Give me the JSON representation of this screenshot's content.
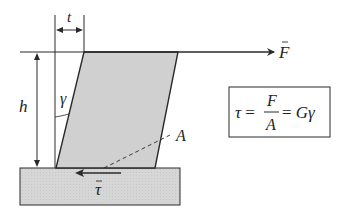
{
  "diagram": {
    "labels": {
      "thickness": "t",
      "height": "h",
      "angle": "γ",
      "force": "F",
      "area": "A",
      "shear_stress": "τ"
    },
    "formula": {
      "lhs": "τ =",
      "numerator": "F",
      "denominator": "A",
      "rhs": "= Gγ"
    },
    "colors": {
      "block_fill": "#d0d0d0",
      "base_fill": "#d6d6d6",
      "line": "#2a2a2a"
    }
  }
}
